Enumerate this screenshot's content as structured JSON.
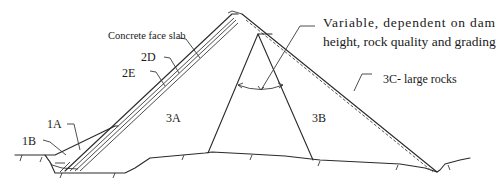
{
  "diagram": {
    "type": "concrete-face rockfill dam cross-section",
    "labels": {
      "concrete_face_slab": "Concrete face slab",
      "zone_2d": "2D",
      "zone_2e": "2E",
      "zone_1a": "1A",
      "zone_1b": "1B",
      "zone_3a": "3A",
      "zone_3b": "3B",
      "zone_3c": "3C- large rocks",
      "variable_line1": "Variable, dependent on dam",
      "variable_line2": "height, rock quality and grading"
    },
    "colors": {
      "line": "#2a2a2a",
      "background": "#ffffff"
    }
  }
}
